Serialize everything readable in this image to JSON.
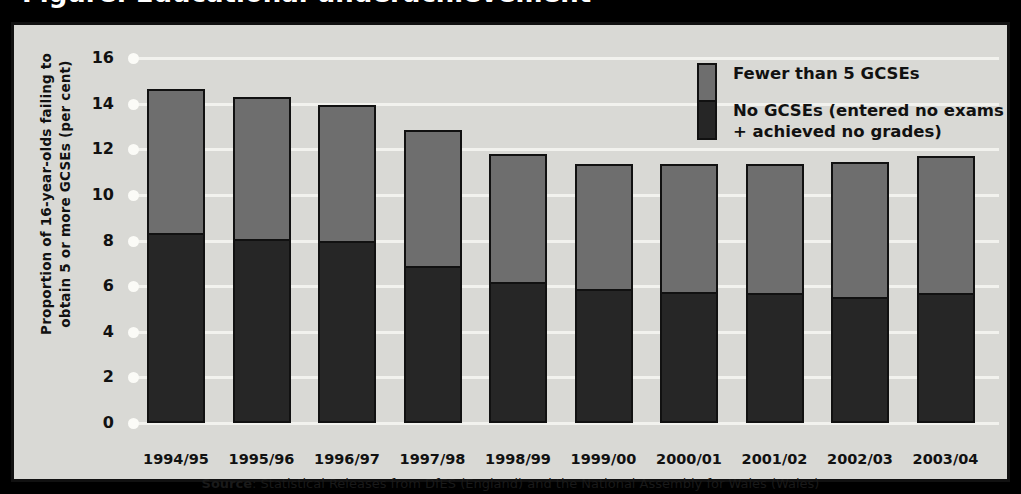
{
  "header": {
    "clipped_title": "Figure: Educational underachievement"
  },
  "legend": [
    {
      "key": "fewer-than-5",
      "label": "Fewer than 5 GCSEs",
      "color": "#6e6e6e"
    },
    {
      "key": "no-gcses",
      "label": "No GCSEs (entered no exams\n+ achieved no grades)",
      "color": "#262626"
    }
  ],
  "source": {
    "prefix": "Source",
    "text": ": Statistical Releases from DfES (England) and the National Assembly for Wales (Wales)"
  },
  "chart_data": {
    "type": "bar",
    "stacked": true,
    "title": "",
    "xlabel": "",
    "ylabel": "Proportion of 16-year-olds failing to obtain 5 or more GCSEs (per cent)",
    "ylim": [
      0,
      16
    ],
    "yticks": [
      0,
      2,
      4,
      6,
      8,
      10,
      12,
      14,
      16
    ],
    "grid": true,
    "legend_position": "top-right",
    "categories": [
      "1994/95",
      "1995/96",
      "1996/97",
      "1997/98",
      "1998/99",
      "1999/00",
      "2000/01",
      "2001/02",
      "2002/03",
      "2003/04"
    ],
    "series": [
      {
        "name": "No GCSEs (entered no exams + achieved no grades)",
        "color": "#262626",
        "values": [
          8.25,
          8.0,
          7.9,
          6.8,
          6.1,
          5.8,
          5.65,
          5.6,
          5.45,
          5.6
        ]
      },
      {
        "name": "Fewer than 5 GCSEs",
        "color": "#6e6e6e",
        "values": [
          6.4,
          6.3,
          6.05,
          6.05,
          5.7,
          5.55,
          5.7,
          5.75,
          6.0,
          6.1
        ]
      }
    ],
    "totals": [
      14.65,
      14.3,
      13.95,
      12.85,
      11.8,
      11.35,
      11.35,
      11.35,
      11.45,
      11.7
    ]
  },
  "colors": {
    "background": "#d9d9d5",
    "grid": "#f2f2ee",
    "frame": "#111111",
    "grey_series": "#6e6e6e",
    "dark_series": "#262626"
  }
}
